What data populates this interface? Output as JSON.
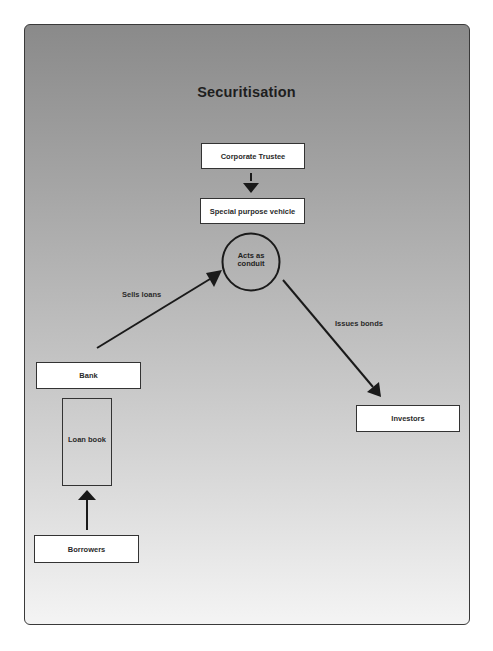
{
  "diagram": {
    "title": "Securitisation",
    "nodes": {
      "corporate_trustee": {
        "label": "Corporate Trustee"
      },
      "spv": {
        "label": "Special purpose vehicle"
      },
      "conduit": {
        "label_line1": "Acts as",
        "label_line2": "conduit"
      },
      "bank": {
        "label": "Bank"
      },
      "loan_book": {
        "label": "Loan book"
      },
      "borrowers": {
        "label": "Borrowers"
      },
      "investors": {
        "label": "Investors"
      }
    },
    "edges": {
      "sells_loans": {
        "label": "Sells loans",
        "from": "bank",
        "to": "conduit"
      },
      "issues_bonds": {
        "label": "Issues bonds",
        "from": "conduit",
        "to": "investors"
      },
      "trustee_to_spv": {
        "label": "",
        "from": "corporate_trustee",
        "to": "spv"
      },
      "borrowers_to_loan_book": {
        "label": "",
        "from": "borrowers",
        "to": "loan_book"
      }
    },
    "colors": {
      "background_top": "#8a8a8a",
      "background_bottom": "#f4f4f4",
      "box_fill": "#ffffff",
      "stroke": "#1a1a1a"
    }
  }
}
